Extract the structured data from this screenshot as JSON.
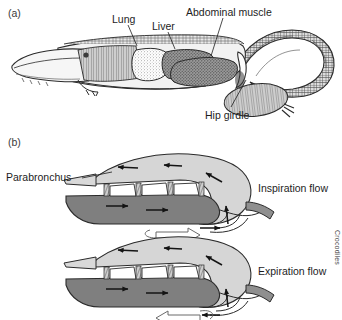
{
  "figure": {
    "panels": [
      {
        "tag": "(a)",
        "x": 8,
        "y": 8,
        "caption": "crocodile-lateral-anatomy"
      },
      {
        "tag": "(b)",
        "x": 8,
        "y": 137,
        "caption": "lung-airflow-schematic"
      }
    ],
    "side_text": "Crocodiles"
  },
  "anatomy_labels": [
    {
      "name": "lung-label",
      "text": "Lung",
      "x": 112,
      "y": 14,
      "leader": {
        "x1": 128,
        "y1": 24,
        "x2": 136,
        "y2": 45
      }
    },
    {
      "name": "liver-label",
      "text": "Liver",
      "x": 152,
      "y": 21,
      "leader": {
        "x1": 168,
        "y1": 31,
        "x2": 174,
        "y2": 48
      }
    },
    {
      "name": "abdominal-muscle-label",
      "text": "Abdominal muscle",
      "x": 186,
      "y": 7,
      "leader": {
        "x1": 222,
        "y1": 17,
        "x2": 212,
        "y2": 55
      }
    },
    {
      "name": "hip-girdle-label",
      "text": "Hip girdle",
      "x": 205,
      "y": 110,
      "leader": {
        "x1": 232,
        "y1": 108,
        "x2": 246,
        "y2": 80
      }
    }
  ],
  "schematic": {
    "parabronchus_label": {
      "text": "Parabronchus",
      "x": 6,
      "y": 172,
      "leader": {
        "x1": 82,
        "y1": 178,
        "x2": 110,
        "y2": 172
      }
    },
    "diagrams": [
      {
        "name": "inspiration-diagram",
        "flow_label": "Inspiration flow",
        "label_x": 258,
        "label_y": 183,
        "offset_y": 0,
        "upper_chamber_arrows": "left",
        "lower_chamber_arrows": "right",
        "trachea_arrow": "right",
        "hollow_arrow": "right"
      },
      {
        "name": "expiration-diagram",
        "flow_label": "Expiration flow",
        "label_x": 258,
        "label_y": 266,
        "offset_y": 83,
        "upper_chamber_arrows": "left",
        "lower_chamber_arrows": "right",
        "trachea_arrow": "left",
        "hollow_arrow": "left"
      }
    ],
    "parabronchi_count": 3
  },
  "colors": {
    "upper_chamber": "#d6d6d6",
    "lower_chamber": "#7f7f7f",
    "trachea": "#8f8f8f",
    "outline": "#2b2b2b",
    "arrow": "#1a1a1a",
    "text": "#1d1d1d",
    "background": "#ffffff"
  }
}
